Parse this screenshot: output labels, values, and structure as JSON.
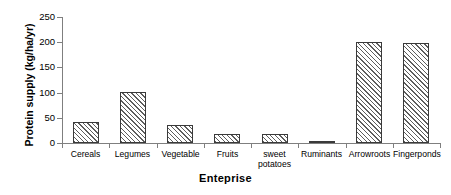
{
  "chart_data": {
    "type": "bar",
    "title": "",
    "subtitle": "",
    "xlabel": "Enteprise",
    "ylabel": "Protein supply (kg/ha/yr)",
    "categories": [
      "Cereals",
      "Legumes",
      "Vegetable",
      "Fruits",
      "sweet\npotatoes",
      "Ruminants",
      "Arrowroots",
      "Fingerponds"
    ],
    "values": [
      41,
      101,
      36,
      18,
      17,
      2,
      201,
      198
    ],
    "ylim": [
      0,
      250
    ],
    "ytick_labels": [
      "0",
      "50",
      "100",
      "150",
      "200",
      "250"
    ],
    "ytick_values": [
      0,
      50,
      100,
      150,
      200,
      250
    ],
    "grid": false,
    "legend": false,
    "legend_position": "none",
    "series": [
      {
        "name": "Protein supply",
        "values": [
          41,
          101,
          36,
          18,
          17,
          2,
          201,
          198
        ]
      }
    ],
    "bar_fill": "diagonal-hatch",
    "colors": {
      "bar_edge": "#3a3a3a",
      "bar_hatch": "#5d5d5d",
      "bar_background": "#ffffff",
      "axis": "#7f7f7f",
      "text": "#000000",
      "plot_background": "#ffffff"
    }
  }
}
